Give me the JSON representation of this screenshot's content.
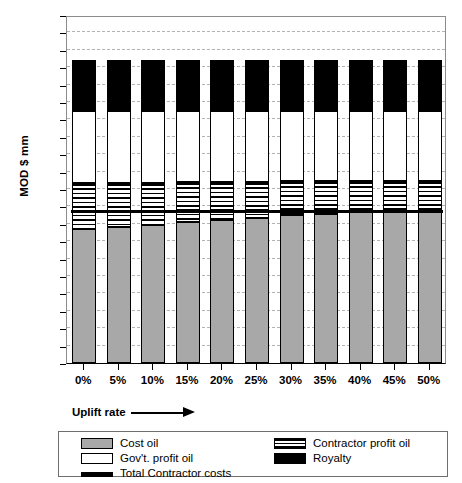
{
  "chart_data": {
    "type": "bar",
    "stacked": true,
    "title": "",
    "xlabel": "Uplift rate",
    "ylabel": "MOD $ mm",
    "categories": [
      "0%",
      "5%",
      "10%",
      "15%",
      "20%",
      "25%",
      "30%",
      "35%",
      "40%",
      "45%",
      "50%"
    ],
    "ylim": [
      0,
      500
    ],
    "ytick_step": 25,
    "yticks": [
      0,
      25,
      50,
      75,
      100,
      125,
      150,
      175,
      200,
      225,
      250,
      275,
      300,
      325,
      350,
      375,
      400,
      425,
      450,
      475,
      500
    ],
    "grid": "horizontal-dashed",
    "legend_position": "bottom",
    "series": [
      {
        "name": "Cost oil",
        "color": "#a8a8a8",
        "values": [
          193,
          196,
          199,
          203,
          206,
          209,
          212,
          214,
          217,
          219,
          222
        ]
      },
      {
        "name": "Contractor profit oil",
        "color": "#000000",
        "pattern": "horizontal-stripes",
        "values": [
          65,
          62,
          60,
          57,
          54,
          51,
          49,
          47,
          45,
          43,
          40
        ]
      },
      {
        "name": "Gov't. profit oil",
        "color": "#ffffff",
        "values": [
          104,
          104,
          103,
          102,
          102,
          102,
          101,
          101,
          100,
          100,
          100
        ]
      },
      {
        "name": "Royalty",
        "color": "#000000",
        "values": [
          73,
          73,
          73,
          73,
          73,
          73,
          73,
          73,
          73,
          73,
          73
        ]
      }
    ],
    "totals": [
      435,
      435,
      435,
      435,
      435,
      435,
      435,
      435,
      435,
      435,
      435
    ],
    "reference_line": {
      "name": "Total Contractor costs",
      "color": "#000000",
      "value": 218,
      "style": "thick-solid"
    }
  },
  "legend": {
    "items": [
      {
        "label": "Cost oil",
        "swatch": "solid-grey"
      },
      {
        "label": "Contractor profit oil",
        "swatch": "striped"
      },
      {
        "label": "Gov't. profit oil",
        "swatch": "solid-white"
      },
      {
        "label": "Royalty",
        "swatch": "solid-black"
      },
      {
        "label": "Total Contractor costs",
        "swatch": "thick-line"
      }
    ]
  },
  "axes": {
    "y_title": "MOD $ mm",
    "x_title": "Uplift rate"
  }
}
